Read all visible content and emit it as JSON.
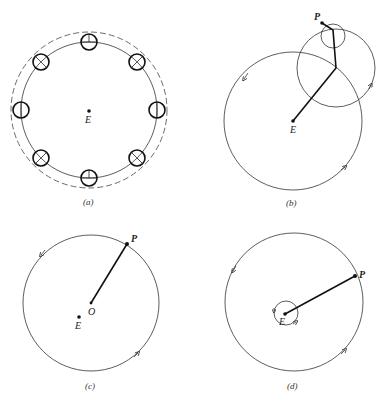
{
  "panels": [
    {
      "id": "a",
      "caption": "(a)",
      "center_label": "E"
    },
    {
      "id": "b",
      "caption": "(b)",
      "center_label": "E",
      "point_label": "P"
    },
    {
      "id": "c",
      "caption": "(c)",
      "center_label": "O",
      "offset_label": "E",
      "point_label": "P"
    },
    {
      "id": "d",
      "caption": "(d)",
      "center_label": "E",
      "point_label": "P"
    }
  ]
}
